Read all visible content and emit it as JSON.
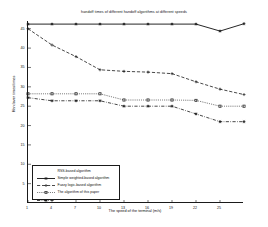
{
  "chart_data": {
    "type": "line",
    "title": "handoff times of different handoff algorithms at different speeds",
    "xlabel": "The speed of the terminal (m/s)",
    "ylabel": "Handover times/times",
    "x": [
      1,
      4,
      7,
      10,
      13,
      16,
      19,
      22,
      25,
      28
    ],
    "xlim": [
      1,
      28
    ],
    "ylim": [
      0,
      47
    ],
    "xticks": [
      1,
      4,
      7,
      10,
      13,
      16,
      19,
      22,
      25
    ],
    "yticks": [
      5,
      10,
      15,
      20,
      25,
      30,
      35,
      40,
      45
    ],
    "grid": false,
    "legend_position": "lower left",
    "series": [
      {
        "name": "RSS-based algorithm",
        "linestyle": "solid",
        "marker": "star",
        "color": "#1a1a1a",
        "values": [
          46.2,
          46.2,
          46.2,
          46.2,
          46.2,
          46.2,
          46.2,
          46.2,
          44.4,
          46.3
        ]
      },
      {
        "name": "Simple weighted-based algorithm",
        "linestyle": "dashed",
        "marker": "plus",
        "color": "#1a1a1a",
        "values": [
          45.0,
          40.8,
          37.8,
          34.4,
          34.0,
          33.8,
          33.4,
          31.3,
          29.4,
          28.0
        ]
      },
      {
        "name": "Fuzzy logic-based algorithm",
        "linestyle": "dotted",
        "marker": "square",
        "color": "#1a1a1a",
        "values": [
          28.2,
          28.2,
          28.2,
          28.2,
          26.6,
          26.6,
          26.6,
          26.5,
          25.0,
          25.0
        ]
      },
      {
        "name": "The algorithm of this paper",
        "linestyle": "dashdot",
        "marker": "star",
        "color": "#1a1a1a",
        "values": [
          27.2,
          26.4,
          26.4,
          26.4,
          25.0,
          25.0,
          25.0,
          23.0,
          21.0,
          21.0
        ]
      }
    ]
  },
  "legend": {
    "items": [
      {
        "label": "RSS-based algorithm"
      },
      {
        "label": "Simple weighted-based algorithm"
      },
      {
        "label": "Fuzzy logic-based algorithm"
      },
      {
        "label": "The algorithm of this paper"
      }
    ]
  }
}
